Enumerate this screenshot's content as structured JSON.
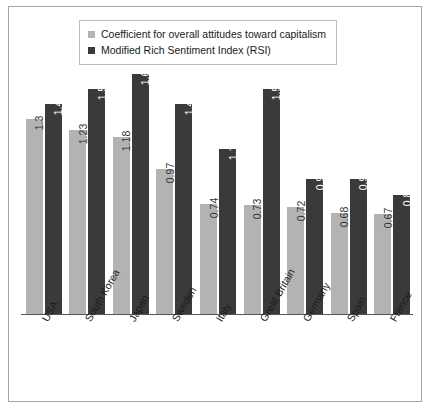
{
  "legend": {
    "items": [
      {
        "label": "Coefficient for overall attitudes toward capitalism",
        "color": "#b3b3b3",
        "swatch_icon": "square-swatch-light"
      },
      {
        "label": "Modified Rich Sentiment Index (RSI)",
        "color": "#3a3a3a",
        "swatch_icon": "square-swatch-dark"
      }
    ]
  },
  "chart_data": {
    "type": "bar",
    "title": "",
    "subtitle": "",
    "xlabel": "",
    "ylabel": "",
    "ylim": [
      0,
      1.7
    ],
    "grid": false,
    "legend_position": "top",
    "categories": [
      "USA",
      "South Korea",
      "Japan",
      "Sweden",
      "Italy",
      "Great Britain",
      "Germany",
      "Spain",
      "France"
    ],
    "series": [
      {
        "name": "Coefficient for overall attitudes toward capitalism",
        "color": "#b3b3b3",
        "values": [
          1.3,
          1.23,
          1.18,
          0.97,
          0.74,
          0.73,
          0.72,
          0.68,
          0.67
        ],
        "labels": [
          "1.3",
          "1.23",
          "1.18",
          "0.97",
          "0.74",
          "0.73",
          "0.72",
          "0.68",
          "0.67"
        ]
      },
      {
        "name": "Modified Rich Sentiment Index (RSI)",
        "color": "#3a3a3a",
        "values": [
          1.4,
          1.5,
          1.6,
          1.4,
          1.1,
          1.5,
          0.9,
          0.9,
          0.8
        ],
        "labels": [
          "1.4",
          "1.5",
          "1.6",
          "1.4",
          "1.1",
          "1.5",
          "0.9",
          "0.9",
          "0.8"
        ]
      }
    ]
  }
}
